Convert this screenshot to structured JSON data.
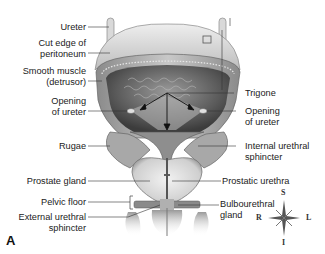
{
  "figure": {
    "panel_letter": "A",
    "labels_left": [
      {
        "id": "ureter",
        "lines": [
          "Ureter"
        ]
      },
      {
        "id": "cut-edge-peritoneum",
        "lines": [
          "Cut edge of",
          "peritoneum"
        ]
      },
      {
        "id": "smooth-muscle",
        "lines": [
          "Smooth muscle",
          "(detrusor)"
        ]
      },
      {
        "id": "opening-ureter-left",
        "lines": [
          "Opening",
          "of ureter"
        ]
      },
      {
        "id": "rugae",
        "lines": [
          "Rugae"
        ]
      },
      {
        "id": "prostate-gland",
        "lines": [
          "Prostate gland"
        ]
      },
      {
        "id": "pelvic-floor",
        "lines": [
          "Pelvic floor"
        ]
      },
      {
        "id": "external-urethral-sphincter",
        "lines": [
          "External urethral",
          "sphincter"
        ]
      }
    ],
    "labels_right": [
      {
        "id": "trigone",
        "lines": [
          "Trigone"
        ]
      },
      {
        "id": "opening-ureter-right",
        "lines": [
          "Opening",
          "of ureter"
        ]
      },
      {
        "id": "internal-urethral-sphincter",
        "lines": [
          "Internal urethral",
          "sphincter"
        ]
      },
      {
        "id": "prostatic-urethra",
        "lines": [
          "Prostatic urethra"
        ]
      },
      {
        "id": "bulbourethral-gland",
        "lines": [
          "Bulbourethral",
          "gland"
        ]
      }
    ],
    "compass": {
      "top": "S",
      "bottom": "I",
      "left": "R",
      "right": "L"
    }
  }
}
